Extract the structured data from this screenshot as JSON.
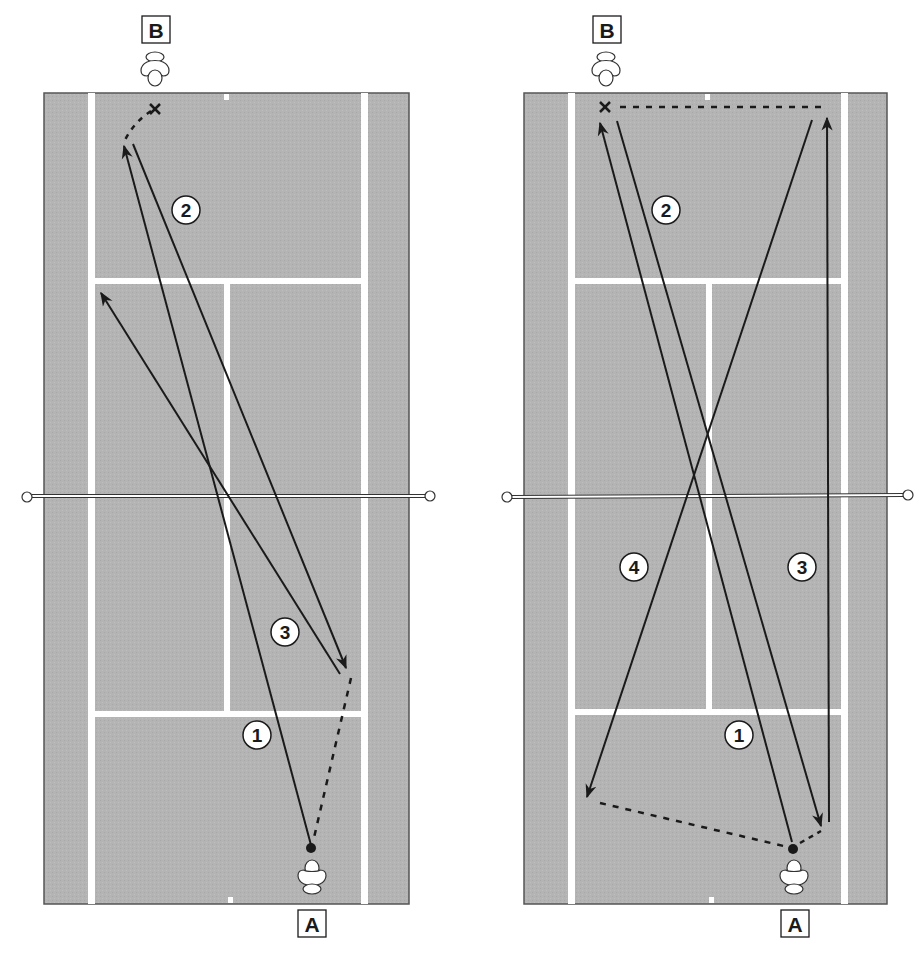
{
  "colors": {
    "court": "#b4b4b4",
    "lines": "#ffffff",
    "ink": "#1a1a1a",
    "border": "#555555",
    "background": "#ffffff"
  },
  "diagrams": [
    {
      "id": "left",
      "labels": {
        "top_player": "B",
        "bottom_player": "A"
      },
      "shots": [
        {
          "num": "1",
          "from": [
            311,
            845
          ],
          "to": [
            124,
            146
          ],
          "style": "solid",
          "arrow": true,
          "label_pos": [
            257,
            735
          ]
        },
        {
          "num": "2",
          "from": [
            133,
            144
          ],
          "to": [
            346,
            668
          ],
          "style": "solid",
          "arrow": true,
          "label_pos": [
            186,
            210
          ]
        },
        {
          "num": "3",
          "from": [
            340,
            674
          ],
          "to": [
            101,
            293
          ],
          "style": "solid",
          "arrow": true,
          "label_pos": [
            285,
            632
          ]
        }
      ],
      "movements": [
        {
          "from": [
            151,
            110
          ],
          "to": [
            125,
            140
          ],
          "curve": true
        },
        {
          "from": [
            351,
            678
          ],
          "to": [
            313,
            842
          ]
        }
      ],
      "target_x": [
        155,
        109
      ],
      "ball": [
        311,
        848
      ]
    },
    {
      "id": "right",
      "labels": {
        "top_player": "B",
        "bottom_player": "A"
      },
      "shots": [
        {
          "num": "1",
          "from": [
            792,
            842
          ],
          "to": [
            600,
            123
          ],
          "style": "solid",
          "arrow": true,
          "label_pos": [
            739,
            735
          ]
        },
        {
          "num": "2",
          "from": [
            617,
            121
          ],
          "to": [
            821,
            826
          ],
          "style": "solid",
          "arrow": true,
          "label_pos": [
            666,
            210
          ]
        },
        {
          "num": "3",
          "from": [
            829,
            822
          ],
          "to": [
            827,
            118
          ],
          "style": "solid",
          "arrow": true,
          "label_pos": [
            802,
            567
          ]
        },
        {
          "num": "4",
          "from": [
            812,
            120
          ],
          "to": [
            587,
            797
          ],
          "style": "solid",
          "arrow": true,
          "label_pos": [
            634,
            567
          ]
        }
      ],
      "movements": [
        {
          "from": [
            620,
            107
          ],
          "to": [
            822,
            107
          ]
        },
        {
          "from": [
            600,
            803
          ],
          "to": [
            788,
            847
          ]
        },
        {
          "from": [
            800,
            843
          ],
          "to": [
            820,
            832
          ]
        }
      ],
      "target_x": [
        605,
        107
      ],
      "ball": [
        793,
        849
      ]
    }
  ]
}
